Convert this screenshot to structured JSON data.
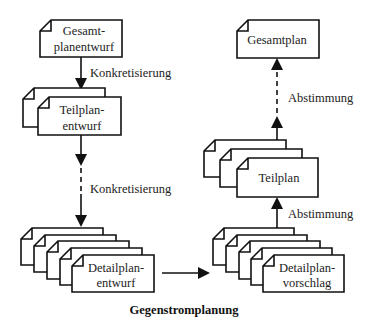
{
  "diagram": {
    "caption": "Gegenstromplanung",
    "left_column": {
      "gesamtplanentwurf": {
        "line1": "Gesamt-",
        "line2": "planentwurf",
        "stack_count": 1
      },
      "teilplanentwurf": {
        "line1": "Teilplan-",
        "line2": "entwurf",
        "stack_count": 2
      },
      "detailplanentwurf": {
        "line1": "Detailplan-",
        "line2": "entwurf",
        "stack_count": 5
      },
      "arrow1_label": "Konkretisierung",
      "arrow2_label": "Konkretisierung"
    },
    "right_column": {
      "gesamtplan": {
        "line1": "Gesamtplan",
        "stack_count": 1
      },
      "teilplan": {
        "line1": "Teilplan",
        "stack_count": 3
      },
      "detailplanvorschlag": {
        "line1": "Detailplan-",
        "line2": "vorschlag",
        "stack_count": 5
      },
      "arrow1_label": "Abstimmung",
      "arrow2_label": "Abstimmung"
    }
  }
}
